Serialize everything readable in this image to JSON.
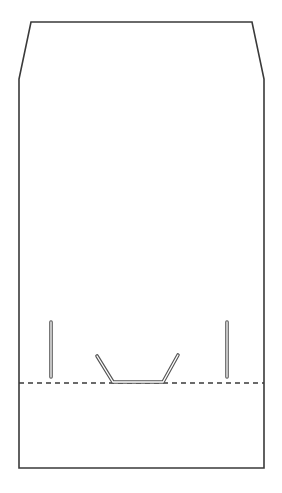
{
  "diagram": {
    "colors": {
      "background": "#ffffff",
      "outline": "#3a3a3a",
      "fold_line": "#3a3a3a",
      "slot_fill": "#ffffff"
    },
    "outline_points": "31,22 252,22 264,79 264,468 19,468 19,79",
    "fold_line": {
      "x1": 19,
      "y1": 383,
      "x2": 264,
      "y2": 383,
      "dash": "5 4"
    },
    "slots": [
      {
        "name": "left-slot",
        "x1": 51,
        "y1": 322,
        "x2": 51,
        "y2": 377
      },
      {
        "name": "right-slot",
        "x1": 227,
        "y1": 322,
        "x2": 227,
        "y2": 377
      }
    ],
    "tab_slot_points": "97,356 113,382 163,382 178,355"
  }
}
